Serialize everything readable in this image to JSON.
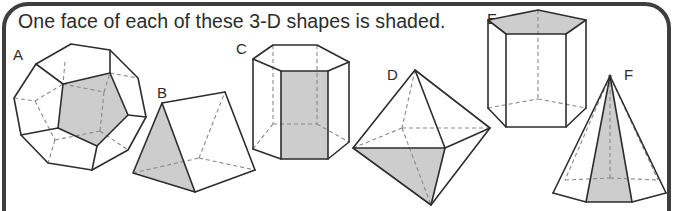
{
  "title": "One face of each of these 3-D shapes is shaded.",
  "shapes": [
    {
      "label": "A",
      "name": "dodecahedron",
      "shaded_face": "pentagon"
    },
    {
      "label": "B",
      "name": "triangular prism",
      "shaded_face": "triangle"
    },
    {
      "label": "C",
      "name": "hexagonal prism",
      "shaded_face": "rectangle"
    },
    {
      "label": "D",
      "name": "octahedron",
      "shaded_face": "triangle"
    },
    {
      "label": "E",
      "name": "pentagonal prism",
      "shaded_face": "pentagon"
    },
    {
      "label": "F",
      "name": "hexagonal pyramid",
      "shaded_face": "triangle"
    }
  ],
  "colors": {
    "shade": "#cdcdcd",
    "edge": "#2d2d2d",
    "hidden_edge": "#8a8a8a",
    "frame": "#3e3e3e"
  }
}
